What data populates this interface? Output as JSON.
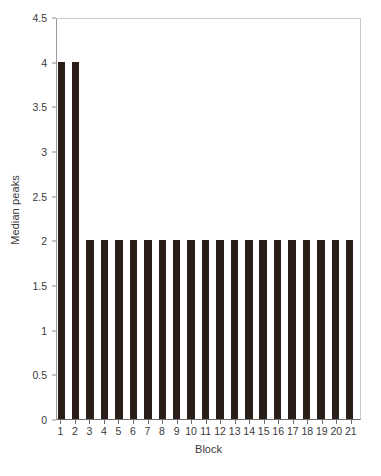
{
  "chart_data": {
    "type": "bar",
    "title": "",
    "xlabel": "Block",
    "ylabel": "Median peaks",
    "categories": [
      "1",
      "2",
      "3",
      "4",
      "5",
      "6",
      "7",
      "8",
      "9",
      "10",
      "11",
      "12",
      "13",
      "14",
      "15",
      "16",
      "17",
      "18",
      "19",
      "20",
      "21"
    ],
    "values": [
      4,
      4,
      2,
      2,
      2,
      2,
      2,
      2,
      2,
      2,
      2,
      2,
      2,
      2,
      2,
      2,
      2,
      2,
      2,
      2,
      2
    ],
    "ylim": [
      0,
      4.5
    ],
    "yticks": [
      "0",
      "0.5",
      "1",
      "1.5",
      "2",
      "2.5",
      "3",
      "3.5",
      "4",
      "4.5"
    ],
    "ytick_values": [
      0,
      0.5,
      1,
      1.5,
      2,
      2.5,
      3,
      3.5,
      4,
      4.5
    ],
    "grid": false,
    "legend": null,
    "bar_color": "#2b1d18",
    "axis_color": "#6e6e6e",
    "background_color": "#ffffff"
  }
}
